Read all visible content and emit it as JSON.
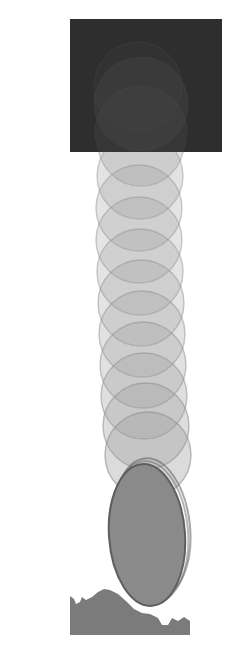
{
  "canvas": {
    "width": 240,
    "height": 657,
    "background": "#ffffff",
    "title": "Falling ball motion trail over terrain"
  },
  "palette": {
    "background": "#ffffff",
    "dark_panel": "#2e2e2e",
    "panel_inner_glow": "#4a4a4a",
    "trail_fill": "#9a9a9a",
    "trail_stroke": "#8d8d8d",
    "solid_ball": "#8a8a8a",
    "solid_ball_stroke": "#5e5e5e",
    "terrain": "#7b7b7b"
  },
  "dark_panel": {
    "name": "dark-backdrop-panel",
    "x": 70,
    "y": 19,
    "width": 152,
    "height": 133,
    "fill": "#2e2e2e",
    "inner_circles": [
      {
        "cx": 141,
        "cy": 104,
        "r": 47,
        "fill": "#4a4a4a",
        "opacity": 0.35
      },
      {
        "cx": 141,
        "cy": 132,
        "r": 46,
        "fill": "#4a4a4a",
        "opacity": 0.3
      },
      {
        "cx": 138,
        "cy": 86,
        "r": 44,
        "fill": "#464646",
        "opacity": 0.22
      }
    ]
  },
  "trail": {
    "name": "motion-trail-circles",
    "count": 11,
    "radius": 42,
    "fill": "#9a9a9a",
    "stroke": "#8d8d8d",
    "stroke_width": 1.4,
    "circles": [
      {
        "cx": 141,
        "cy": 143,
        "r": 43,
        "opacity": 0.3,
        "stroke_opacity": 0.4
      },
      {
        "cx": 140,
        "cy": 176,
        "r": 43,
        "opacity": 0.28,
        "stroke_opacity": 0.42
      },
      {
        "cx": 139,
        "cy": 208,
        "r": 43,
        "opacity": 0.27,
        "stroke_opacity": 0.44
      },
      {
        "cx": 139,
        "cy": 240,
        "r": 43,
        "opacity": 0.27,
        "stroke_opacity": 0.45
      },
      {
        "cx": 140,
        "cy": 272,
        "r": 43,
        "opacity": 0.27,
        "stroke_opacity": 0.46
      },
      {
        "cx": 141,
        "cy": 303,
        "r": 43,
        "opacity": 0.28,
        "stroke_opacity": 0.47
      },
      {
        "cx": 142,
        "cy": 334,
        "r": 43,
        "opacity": 0.29,
        "stroke_opacity": 0.48
      },
      {
        "cx": 143,
        "cy": 365,
        "r": 43,
        "opacity": 0.3,
        "stroke_opacity": 0.5
      },
      {
        "cx": 144,
        "cy": 396,
        "r": 43,
        "opacity": 0.32,
        "stroke_opacity": 0.52
      },
      {
        "cx": 146,
        "cy": 426,
        "r": 43,
        "opacity": 0.34,
        "stroke_opacity": 0.55
      },
      {
        "cx": 148,
        "cy": 455,
        "r": 43,
        "opacity": 0.36,
        "stroke_opacity": 0.58
      }
    ]
  },
  "solid_ball": {
    "name": "resting-ball",
    "cx": 147,
    "cy": 535,
    "rx": 38,
    "ry": 71,
    "rotation": -4,
    "fill": "#8a8a8a",
    "stroke": "#5e5e5e",
    "stroke_width": 2,
    "echo_outlines": [
      {
        "cx": 152,
        "cy": 528,
        "rx": 38,
        "ry": 70,
        "rotation": -6,
        "stroke_opacity": 0.55
      },
      {
        "cx": 150,
        "cy": 532,
        "rx": 38,
        "ry": 71,
        "rotation": -5,
        "stroke_opacity": 0.45
      }
    ]
  },
  "terrain": {
    "name": "ground-terrain",
    "fill": "#7b7b7b",
    "path": "M 70 611 L 70 635 L 190 635 L 190 621 L 184 617 L 178 621 L 172 618 L 168 625 L 162 625 L 158 618 L 150 614 L 142 613 L 134 609 L 126 601 L 118 594 L 110 590 L 104 589 L 98 592 L 92 597 L 86 600 L 82 597 L 80 602 L 76 604 L 74 599 L 70 596 Z"
  },
  "labels": {
    "caption": ""
  }
}
